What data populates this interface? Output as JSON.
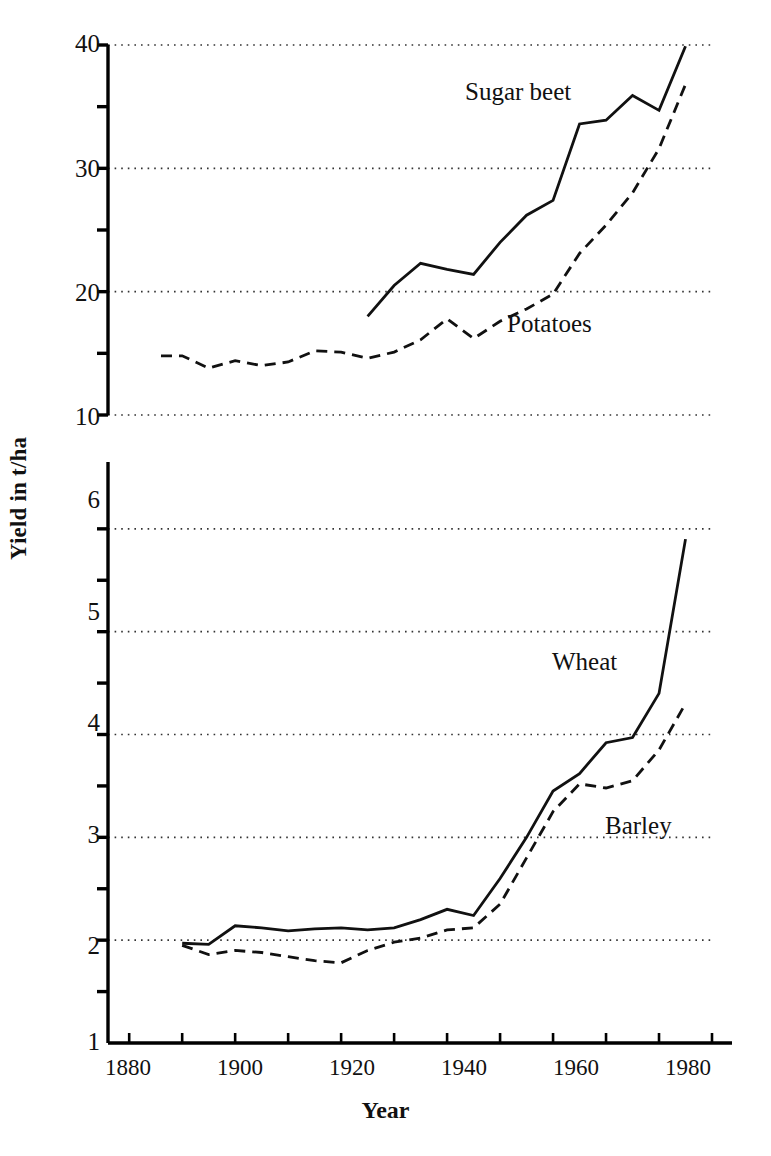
{
  "figure": {
    "xlabel": "Year",
    "ylabel": "Yield in t/ha",
    "caption": ""
  },
  "axes": {
    "x_ticks_major": [
      "1880",
      "1900",
      "1920",
      "1940",
      "1960",
      "1980"
    ],
    "x_min": 1876,
    "x_max": 1990,
    "x_tick_step_minor": 10,
    "top_y_ticks": [
      "40",
      "30",
      "20",
      "10"
    ],
    "bottom_y_ticks": [
      "6",
      "5",
      "4",
      "3",
      "2",
      "1"
    ]
  },
  "labels": {
    "sugar_beet": "Sugar beet",
    "potatoes": "Potatoes",
    "wheat": "Wheat",
    "barley": "Barley"
  },
  "colors": {
    "line": "#111111",
    "grid": "#333333",
    "axis": "#000000",
    "background": "#ffffff"
  },
  "chart_data": [
    {
      "type": "line",
      "title": "",
      "xlabel": "Year",
      "ylabel": "Yield in t/ha",
      "xlim": [
        1876,
        1990
      ],
      "ylim": [
        10,
        40
      ],
      "grid": true,
      "gridlines_y": [
        10,
        20,
        30,
        40
      ],
      "minor_ticks_y": [
        15,
        25,
        35
      ],
      "legend": "inline-annotations",
      "series": [
        {
          "name": "Sugar beet",
          "style": "solid",
          "x": [
            1925,
            1930,
            1935,
            1940,
            1945,
            1950,
            1955,
            1960,
            1965,
            1970,
            1975,
            1980,
            1985
          ],
          "y": [
            18.0,
            20.5,
            22.3,
            21.8,
            21.4,
            24.0,
            26.2,
            27.4,
            33.6,
            33.9,
            35.9,
            34.7,
            39.9
          ]
        },
        {
          "name": "Potatoes",
          "style": "dashed",
          "x": [
            1886,
            1890,
            1895,
            1900,
            1905,
            1910,
            1915,
            1920,
            1925,
            1930,
            1935,
            1940,
            1945,
            1950,
            1955,
            1960,
            1965,
            1970,
            1975,
            1980,
            1985
          ],
          "y": [
            14.8,
            14.8,
            13.8,
            14.4,
            14.0,
            14.3,
            15.2,
            15.1,
            14.6,
            15.1,
            16.1,
            17.8,
            16.2,
            17.6,
            18.6,
            19.8,
            23.1,
            25.4,
            28.0,
            31.6,
            36.8
          ]
        }
      ]
    },
    {
      "type": "line",
      "title": "",
      "xlabel": "Year",
      "ylabel": "Yield in t/ha",
      "xlim": [
        1876,
        1990
      ],
      "ylim": [
        1,
        6.65
      ],
      "grid": true,
      "gridlines_y": [
        2,
        3,
        4,
        5,
        6
      ],
      "minor_ticks_y": [
        1.5,
        2.5,
        3.5,
        4.5,
        5.5
      ],
      "legend": "inline-annotations",
      "series": [
        {
          "name": "Wheat",
          "style": "solid",
          "x": [
            1890,
            1895,
            1900,
            1905,
            1910,
            1915,
            1920,
            1925,
            1930,
            1935,
            1940,
            1945,
            1950,
            1955,
            1960,
            1965,
            1970,
            1975,
            1980,
            1985
          ],
          "y": [
            1.97,
            1.96,
            2.14,
            2.12,
            2.09,
            2.11,
            2.12,
            2.1,
            2.12,
            2.2,
            2.3,
            2.24,
            2.6,
            3.0,
            3.45,
            3.62,
            3.92,
            3.97,
            4.4,
            5.9,
            6.35
          ]
        },
        {
          "name": "Barley",
          "style": "dashed",
          "x": [
            1890,
            1895,
            1900,
            1905,
            1910,
            1915,
            1920,
            1925,
            1930,
            1935,
            1940,
            1945,
            1950,
            1955,
            1960,
            1965,
            1970,
            1975,
            1980,
            1985
          ],
          "y": [
            1.95,
            1.86,
            1.9,
            1.88,
            1.84,
            1.8,
            1.78,
            1.9,
            1.98,
            2.02,
            2.1,
            2.12,
            2.35,
            2.8,
            3.25,
            3.52,
            3.48,
            3.55,
            3.85,
            4.3,
            5.1
          ]
        }
      ]
    }
  ]
}
